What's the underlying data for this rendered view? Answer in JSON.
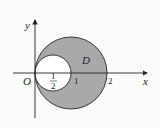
{
  "diagram": {
    "type": "region-between-circles",
    "axes": {
      "x_label": "x",
      "y_label": "y",
      "origin_label": "O"
    },
    "ticks": {
      "half_num": "1",
      "half_den": "2",
      "one": "1",
      "two": "2"
    },
    "region_label": "D",
    "outer_circle": {
      "center": [
        1,
        0
      ],
      "radius": 1
    },
    "inner_circle": {
      "center": [
        0.5,
        0
      ],
      "radius": 0.5
    },
    "colors": {
      "shaded": "#a9a9a9",
      "inner": "#ffffff",
      "stroke": "#222222",
      "background": "#fbfbfa"
    }
  }
}
